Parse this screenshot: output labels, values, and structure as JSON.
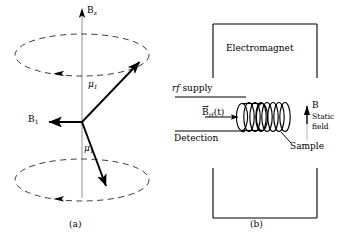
{
  "figure": {
    "background": "#ffffff",
    "ink": "#000000",
    "panels": [
      {
        "id": "a",
        "caption": "(a)",
        "title": "Larmor precession of magnetic moment about static field",
        "axis_label": "B",
        "axis_sub": "z",
        "b1_label": "B",
        "b1_sub": "1",
        "mu_label_upper": "μ",
        "mu_sub_upper": "1",
        "mu_label_lower": "μ",
        "mu_sub_lower": "1",
        "precession_cones": 2,
        "dashed_circles": 2
      },
      {
        "id": "b",
        "caption": "(b)",
        "title": "Nuclear magnetic resonance apparatus",
        "electromagnet_label": "Electromagnet",
        "rf_supply_label_italic": "rf",
        "rf_supply_label_rest": " supply",
        "brf_label": "B",
        "brf_sub": "rf",
        "brf_arg": "(t)",
        "detection_label": "Detection",
        "sample_label": "Sample",
        "static_field_b": "B",
        "static_field_line1": "Static",
        "static_field_line2": "field",
        "coil_turns": 7
      }
    ]
  }
}
